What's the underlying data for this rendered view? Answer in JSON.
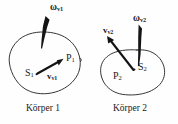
{
  "figure": {
    "background_color": "#fefefe",
    "ink_color": "#1a1a1a",
    "width": 178,
    "height": 124
  },
  "bodies": [
    {
      "id": "koerper-1",
      "caption": "Körper 1",
      "center_of_mass": {
        "base": "S",
        "sub": "1"
      },
      "point": {
        "base": "P",
        "sub": "1"
      },
      "angular_velocity": {
        "base": "ω",
        "sub": "v1"
      },
      "linear_velocity": {
        "base": "v",
        "sub": "v1"
      }
    },
    {
      "id": "koerper-2",
      "caption": "Körper 2",
      "center_of_mass": {
        "base": "S",
        "sub": "2"
      },
      "point": {
        "base": "P",
        "sub": "2"
      },
      "angular_velocity": {
        "base": "ω",
        "sub": "v2"
      },
      "linear_velocity": {
        "base": "v",
        "sub": "v2"
      }
    }
  ],
  "labels": {
    "omega_v1_base": "ω",
    "omega_v1_sub": "v1",
    "omega_v2_base": "ω",
    "omega_v2_sub": "v2",
    "v_v1_base": "v",
    "v_v1_sub": "v1",
    "v_v2_base": "v",
    "v_v2_sub": "v2",
    "s1_base": "S",
    "s1_sub": "1",
    "s2_base": "S",
    "s2_sub": "2",
    "p1_base": "P",
    "p1_sub": "1",
    "p2_base": "P",
    "p2_sub": "2",
    "caption_1": "Körper 1",
    "caption_2": "Körper 2"
  }
}
